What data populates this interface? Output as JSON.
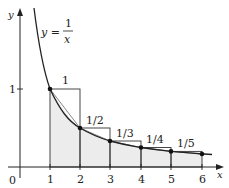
{
  "diagram": {
    "equation": {
      "lhs": "y =",
      "numerator": "1",
      "denominator": "x"
    },
    "axes": {
      "x_label": "x",
      "y_label": "y",
      "origin_label": "0",
      "x_ticks": [
        "1",
        "2",
        "3",
        "4",
        "5",
        "6"
      ],
      "y_ticks": [
        "1"
      ]
    },
    "rectangle_labels": [
      "1",
      "1/2",
      "1/3",
      "1/4",
      "1/5"
    ],
    "points": [
      {
        "x": 1,
        "y": 1
      },
      {
        "x": 2,
        "y": 0.5
      },
      {
        "x": 3,
        "y": 0.3333
      },
      {
        "x": 4,
        "y": 0.25
      },
      {
        "x": 5,
        "y": 0.2
      },
      {
        "x": 6,
        "y": 0.1667
      }
    ],
    "colors": {
      "line": "#222222",
      "shade": "#ececec"
    }
  }
}
